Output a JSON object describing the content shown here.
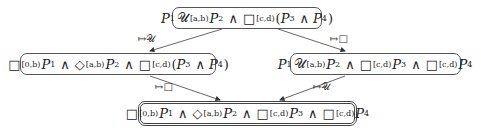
{
  "nodes": {
    "top": {
      "parts": [
        "P",
        "1",
        "𝒰",
        "[a,b)",
        "P",
        "2",
        "∧",
        "□",
        "[c,d)",
        "(P",
        "3",
        "∧",
        "P",
        "4",
        ")"
      ],
      "text": "P1 U[a,b) P2 ∧ □[c,d)(P3 ∧ P4)"
    },
    "left": {
      "text": "□[0,b) P1 ∧ ◇[a,b) P2 ∧ □[c,d)(P3 ∧ P4)"
    },
    "right": {
      "text": "P1 U[a,b) P2 ∧ □[c,d) P3 ∧ □[c,d) P4"
    },
    "bottom": {
      "text": "□[0,b) P1 ∧ ◇[a,b) P2 ∧ □[c,d) P3 ∧ □[c,d) P4",
      "style": "double-border"
    }
  },
  "edges": [
    {
      "from": "top",
      "to": "left",
      "label": "↦𝒰"
    },
    {
      "from": "top",
      "to": "right",
      "label": "↦□"
    },
    {
      "from": "left",
      "to": "bottom",
      "label": "↦□"
    },
    {
      "from": "right",
      "to": "bottom",
      "label": "↦𝒰"
    }
  ],
  "t": {
    "P": "P",
    "n1": "1",
    "n2": "2",
    "n3": "3",
    "n4": "4",
    "U": "𝒰",
    "box": "□",
    "dia": "◇",
    "and": "∧",
    "ab": "[a,b)",
    "cd": "[c,d)",
    "zb": "[0,b)",
    "lp": "(",
    "rp": ")"
  }
}
